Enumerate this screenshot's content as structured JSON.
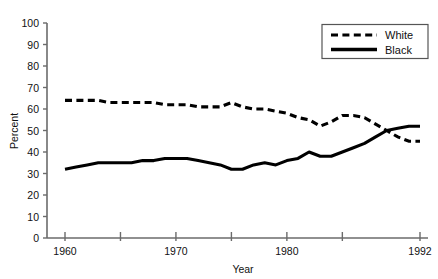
{
  "chart_data": {
    "type": "line",
    "title": "",
    "xlabel": "Year",
    "ylabel": "Percent",
    "xlim": [
      1960,
      1992
    ],
    "ylim": [
      0,
      100
    ],
    "grid": false,
    "legend_position": "top-right",
    "x_ticks": [
      1960,
      1965,
      1970,
      1975,
      1980,
      1985,
      1992
    ],
    "x_tick_labels": [
      "1960",
      "",
      "1970",
      "",
      "1980",
      "",
      "1992"
    ],
    "y_ticks": [
      0,
      10,
      20,
      30,
      40,
      50,
      60,
      70,
      80,
      90,
      100
    ],
    "y_tick_labels": [
      "0",
      "10",
      "20",
      "30",
      "40",
      "50",
      "60",
      "70",
      "80",
      "90",
      "100"
    ],
    "x": [
      1960,
      1961,
      1962,
      1963,
      1964,
      1965,
      1966,
      1967,
      1968,
      1969,
      1970,
      1971,
      1972,
      1973,
      1974,
      1975,
      1976,
      1977,
      1978,
      1979,
      1980,
      1981,
      1982,
      1983,
      1984,
      1985,
      1986,
      1987,
      1988,
      1989,
      1990,
      1991,
      1992
    ],
    "series": [
      {
        "name": "White",
        "style": "dashed",
        "color": "#000000",
        "values": [
          64,
          64,
          64,
          64,
          63,
          63,
          63,
          63,
          63,
          62,
          62,
          62,
          61,
          61,
          61,
          63,
          61,
          60,
          60,
          59,
          58,
          56,
          55,
          52,
          54,
          57,
          57,
          56,
          53,
          50,
          47,
          45,
          45
        ]
      },
      {
        "name": "Black",
        "style": "solid",
        "color": "#000000",
        "values": [
          32,
          33,
          34,
          35,
          35,
          35,
          35,
          36,
          36,
          37,
          37,
          37,
          36,
          35,
          34,
          32,
          32,
          34,
          35,
          34,
          36,
          37,
          40,
          38,
          38,
          40,
          42,
          44,
          47,
          50,
          51,
          52,
          52
        ]
      }
    ]
  },
  "legend": {
    "entries": [
      {
        "label": "White",
        "style": "dashed"
      },
      {
        "label": "Black",
        "style": "solid"
      }
    ]
  },
  "axes": {
    "x_title": "Year",
    "y_title": "Percent"
  }
}
